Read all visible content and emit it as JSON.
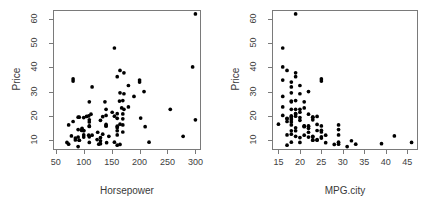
{
  "figure": {
    "background": "#ffffff",
    "frame_color": "#7a7a7a",
    "point_color": "#000000",
    "tick_label_color": "#404040",
    "axis_title_color": "#3a3a3a",
    "panel_count": 2
  },
  "chart_data": [
    {
      "type": "scatter",
      "title": "",
      "xlabel": "Horsepower",
      "ylabel": "Price",
      "xlim": [
        45,
        310
      ],
      "ylim": [
        6.0,
        63.5
      ],
      "xticks": [
        50,
        100,
        150,
        200,
        250,
        300
      ],
      "yticks": [
        10,
        20,
        30,
        40,
        50,
        60
      ],
      "xtick_labels": [
        "50",
        "100",
        "150",
        "200",
        "250",
        "300"
      ],
      "ytick_labels": [
        "10",
        "20",
        "30",
        "40",
        "50",
        "60"
      ],
      "grid": false,
      "legend": false,
      "marker": "filled-circle",
      "marker_size": 3,
      "n_points": 93,
      "x": [
        140,
        200,
        172,
        172,
        208,
        110,
        170,
        180,
        170,
        200,
        295,
        170,
        110,
        160,
        110,
        170,
        165,
        170,
        165,
        110,
        160,
        165,
        155,
        100,
        125,
        160,
        210,
        110,
        100,
        100,
        90,
        85,
        90,
        140,
        100,
        155,
        140,
        160,
        127,
        134,
        105,
        115,
        110,
        160,
        92,
        92,
        160,
        155,
        190,
        81,
        81,
        160,
        165,
        145,
        140,
        202,
        180,
        115,
        96,
        151,
        73,
        92,
        113,
        90,
        141,
        130,
        81,
        73,
        85,
        90,
        130,
        130,
        300,
        130,
        140,
        70,
        78,
        300,
        97,
        124,
        164,
        278,
        255,
        138,
        160,
        217,
        109,
        100,
        110,
        134,
        109,
        168,
        172
      ],
      "y": [
        15.9,
        33.9,
        29.1,
        37.7,
        30.0,
        15.7,
        20.8,
        23.7,
        26.3,
        34.7,
        40.1,
        13.4,
        11.4,
        15.1,
        15.9,
        16.3,
        16.6,
        18.8,
        38.7,
        18.4,
        15.8,
        29.5,
        9.2,
        11.3,
        13.3,
        19.0,
        15.6,
        25.8,
        12.2,
        19.3,
        7.4,
        10.1,
        11.3,
        15.9,
        14.0,
        19.9,
        20.2,
        20.9,
        8.4,
        12.5,
        19.8,
        12.1,
        17.5,
        8.0,
        10.0,
        10.0,
        13.9,
        47.9,
        28.0,
        35.2,
        34.3,
        36.1,
        8.3,
        11.6,
        16.5,
        19.1,
        32.5,
        31.9,
        14.1,
        21.5,
        16.3,
        19.5,
        20.7,
        14.4,
        9.0,
        11.1,
        17.7,
        8.4,
        10.9,
        19.5,
        8.6,
        9.8,
        18.4,
        18.2,
        22.7,
        9.1,
        11.8,
        61.9,
        14.9,
        10.3,
        26.1,
        11.6,
        22.7,
        25.8,
        12.2,
        9.2,
        12.1,
        13.9,
        9.1,
        19.7,
        20.0,
        23.3,
        22.7
      ]
    },
    {
      "type": "scatter",
      "title": "",
      "xlabel": "MPG.city",
      "ylabel": "Price",
      "xlim": [
        13.5,
        47.5
      ],
      "ylim": [
        6.0,
        63.5
      ],
      "xticks": [
        15,
        20,
        25,
        30,
        35,
        40,
        45
      ],
      "yticks": [
        10,
        20,
        30,
        40,
        50,
        60
      ],
      "xtick_labels": [
        "15",
        "20",
        "25",
        "30",
        "35",
        "40",
        "45"
      ],
      "ytick_labels": [
        "10",
        "20",
        "30",
        "40",
        "50",
        "60"
      ],
      "grid": false,
      "legend": false,
      "marker": "filled-circle",
      "marker_size": 3,
      "n_points": 93,
      "x": [
        25,
        18,
        20,
        19,
        22,
        22,
        19,
        16,
        19,
        16,
        16,
        25,
        25,
        19,
        21,
        18,
        15,
        17,
        17,
        23,
        21,
        18,
        29,
        23,
        22,
        17,
        21,
        18,
        29,
        20,
        31,
        23,
        22,
        22,
        24,
        19,
        16,
        19,
        29,
        18,
        24,
        26,
        18,
        17,
        23,
        24,
        19,
        16,
        16,
        25,
        25,
        19,
        28,
        23,
        24,
        18,
        20,
        18,
        25,
        20,
        29,
        23,
        22,
        29,
        26,
        20,
        17,
        33,
        25,
        23,
        39,
        32,
        18,
        20,
        19,
        46,
        42,
        19,
        22,
        24,
        18,
        19,
        18,
        21,
        17,
        18,
        21,
        18,
        20,
        18,
        18,
        21,
        20
      ],
      "y": [
        15.9,
        33.9,
        29.1,
        37.7,
        30.0,
        15.7,
        20.8,
        23.7,
        26.3,
        34.7,
        40.1,
        13.4,
        11.4,
        15.1,
        15.9,
        16.3,
        16.6,
        18.8,
        38.7,
        18.4,
        15.8,
        29.5,
        9.2,
        11.3,
        13.3,
        19.0,
        15.6,
        25.8,
        12.2,
        19.3,
        7.4,
        10.1,
        11.3,
        15.9,
        14.0,
        19.9,
        20.2,
        20.9,
        8.4,
        12.5,
        19.8,
        12.1,
        17.5,
        8.0,
        10.0,
        10.0,
        13.9,
        47.9,
        28.0,
        35.2,
        34.3,
        36.1,
        8.3,
        11.6,
        16.5,
        19.1,
        32.5,
        31.9,
        14.1,
        21.5,
        16.3,
        19.5,
        20.7,
        14.4,
        9.0,
        11.1,
        17.7,
        8.4,
        10.9,
        19.5,
        8.6,
        9.8,
        18.4,
        18.2,
        22.7,
        9.1,
        11.8,
        61.9,
        14.9,
        10.3,
        26.1,
        11.6,
        22.7,
        25.8,
        12.2,
        9.2,
        12.1,
        13.9,
        9.1,
        19.7,
        20.0,
        23.3,
        22.7
      ]
    }
  ]
}
